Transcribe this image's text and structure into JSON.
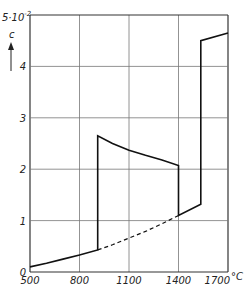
{
  "chart_data": {
    "type": "line",
    "title": "",
    "xlabel": "°C",
    "ylabel": "c",
    "y_scale_label": "5·10^-2",
    "xlim": [
      500,
      1700
    ],
    "ylim": [
      0,
      5
    ],
    "grid": true,
    "x_ticks": [
      500,
      800,
      1100,
      1400,
      1700
    ],
    "x_tick_labels": [
      "500",
      "800",
      "1100",
      "1400",
      "1700"
    ],
    "y_ticks": [
      0,
      1,
      2,
      3,
      4,
      5
    ],
    "y_tick_labels": [
      "0",
      "1",
      "2",
      "3",
      "4",
      "5·10⁻²"
    ],
    "series": [
      {
        "name": "solid-curve",
        "style": "solid",
        "x": [
          500,
          600,
          700,
          800,
          910,
          910,
          1000,
          1100,
          1200,
          1300,
          1400,
          1400,
          1535,
          1535,
          1700
        ],
        "y": [
          0.1,
          0.17,
          0.25,
          0.33,
          0.43,
          2.65,
          2.5,
          2.37,
          2.27,
          2.18,
          2.07,
          1.1,
          1.32,
          4.5,
          4.65
        ]
      },
      {
        "name": "dashed-extrapolation",
        "style": "dashed",
        "x": [
          910,
          1000,
          1100,
          1200,
          1300,
          1400
        ],
        "y": [
          0.43,
          0.53,
          0.66,
          0.79,
          0.94,
          1.1
        ]
      }
    ]
  },
  "labels": {
    "y_unit_top": "5·10",
    "y_unit_exp": "-2",
    "y_var": "c",
    "x_unit": "°C"
  }
}
